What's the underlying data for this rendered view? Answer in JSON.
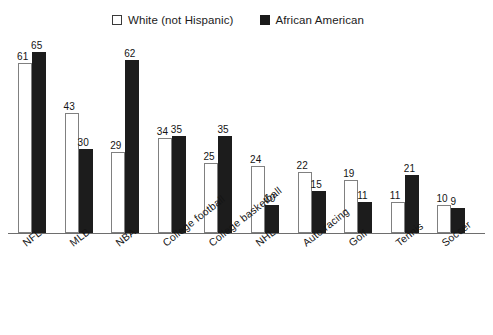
{
  "legend": {
    "entries": [
      {
        "label": "White (not Hispanic)",
        "swatch": "open-square-icon",
        "color": "#ffffff"
      },
      {
        "label": "African American",
        "swatch": "filled-square-icon",
        "color": "#1c1c1c"
      }
    ]
  },
  "chart_data": {
    "type": "bar",
    "title": "",
    "subtitle": "",
    "xlabel": "",
    "ylabel": "",
    "ylim": [
      0,
      65
    ],
    "grid": false,
    "legend_position": "top-center",
    "value_labels": true,
    "categories": [
      "NFL",
      "MLB",
      "NBA",
      "College football",
      "College basketball",
      "NHL",
      "Auto racing",
      "Golf",
      "Tennis",
      "Soccer"
    ],
    "series": [
      {
        "name": "White (not Hispanic)",
        "color": "#ffffff",
        "values": [
          61,
          43,
          29,
          34,
          25,
          24,
          22,
          19,
          11,
          10
        ]
      },
      {
        "name": "African American",
        "color": "#1c1c1c",
        "values": [
          65,
          30,
          62,
          35,
          35,
          10,
          15,
          11,
          21,
          9
        ]
      }
    ]
  }
}
